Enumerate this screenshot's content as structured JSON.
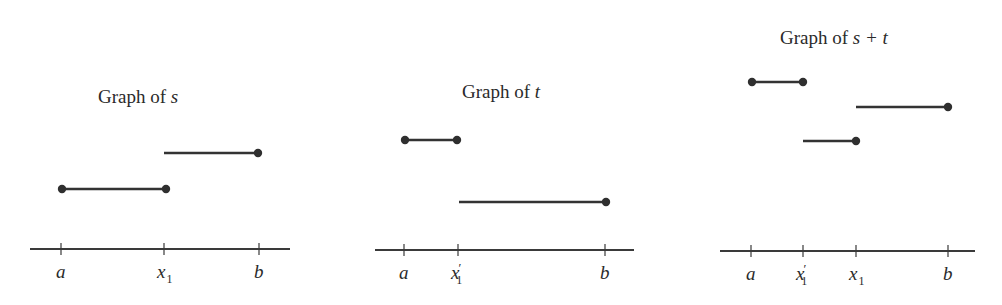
{
  "figure": {
    "colors": {
      "ink": "#333333",
      "background": "#ffffff"
    }
  },
  "panels": [
    {
      "id": "s",
      "title": {
        "prefix": "Graph of ",
        "var": "s",
        "x": 98,
        "y": 103
      },
      "axis": {
        "x1": 30,
        "x2": 290,
        "y": 249
      },
      "ticks": [
        {
          "x": 61,
          "label": "a",
          "sub": "",
          "prime": false
        },
        {
          "x": 164,
          "label": "x",
          "sub": "1",
          "prime": false
        },
        {
          "x": 259,
          "label": "b",
          "sub": "",
          "prime": false
        }
      ],
      "segments": [
        {
          "x1": 62,
          "x2": 166,
          "y": 189,
          "dot_left": true,
          "dot_right": true
        },
        {
          "x1": 164,
          "x2": 258,
          "y": 153,
          "dot_left": false,
          "dot_right": true
        }
      ]
    },
    {
      "id": "t",
      "title": {
        "prefix": "Graph of ",
        "var": "t",
        "x": 462,
        "y": 98
      },
      "axis": {
        "x1": 375,
        "x2": 634,
        "y": 250
      },
      "ticks": [
        {
          "x": 404,
          "label": "a",
          "sub": "",
          "prime": false
        },
        {
          "x": 458,
          "label": "x",
          "sub": "1",
          "prime": true
        },
        {
          "x": 605,
          "label": "b",
          "sub": "",
          "prime": false
        }
      ],
      "segments": [
        {
          "x1": 405,
          "x2": 457,
          "y": 140,
          "dot_left": true,
          "dot_right": true
        },
        {
          "x1": 459,
          "x2": 606,
          "y": 202,
          "dot_left": false,
          "dot_right": true
        }
      ]
    },
    {
      "id": "s-plus-t",
      "title": {
        "prefix": "Graph of ",
        "var": "s + t",
        "x": 780,
        "y": 44
      },
      "axis": {
        "x1": 720,
        "x2": 975,
        "y": 251
      },
      "ticks": [
        {
          "x": 751,
          "label": "a",
          "sub": "",
          "prime": false
        },
        {
          "x": 803,
          "label": "x",
          "sub": "1",
          "prime": true
        },
        {
          "x": 856,
          "label": "x",
          "sub": "1",
          "prime": false
        },
        {
          "x": 948,
          "label": "b",
          "sub": "",
          "prime": false
        }
      ],
      "segments": [
        {
          "x1": 752,
          "x2": 803,
          "y": 82,
          "dot_left": true,
          "dot_right": true
        },
        {
          "x1": 856,
          "x2": 948,
          "y": 107,
          "dot_left": false,
          "dot_right": true
        },
        {
          "x1": 803,
          "x2": 856,
          "y": 141,
          "dot_left": false,
          "dot_right": true
        }
      ]
    }
  ]
}
